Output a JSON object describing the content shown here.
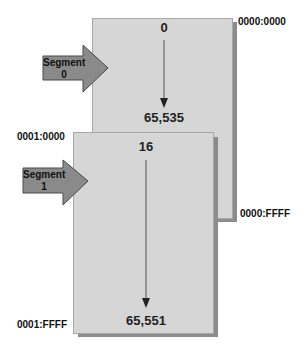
{
  "diagram": {
    "segments": [
      {
        "label_line1": "Segment",
        "label_line2": "0",
        "start_offset": "0",
        "end_offset": "65,535",
        "start_address": "0000:0000",
        "end_address": "0000:FFFF"
      },
      {
        "label_line1": "Segment",
        "label_line2": "1",
        "start_offset": "16",
        "end_offset": "65,551",
        "start_address": "0001:0000",
        "end_address": "0001:FFFF"
      }
    ],
    "colors": {
      "box_fill": "#d6d6d6",
      "box_shadow": "#8c8c8c",
      "segment_arrow_fill": "#8a8a8a",
      "segment_arrow_stroke": "#4a4a4a",
      "pointer_line": "#555555"
    }
  }
}
